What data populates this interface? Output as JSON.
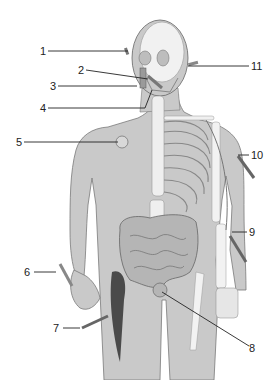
{
  "diagram": {
    "type": "anatomical-figure",
    "labels": [
      {
        "id": 1,
        "text": "1",
        "x": 40,
        "y": 45,
        "target": [
          128,
          51
        ]
      },
      {
        "id": 2,
        "text": "2",
        "x": 78,
        "y": 64,
        "target": [
          148,
          79
        ]
      },
      {
        "id": 3,
        "text": "3",
        "x": 50,
        "y": 80,
        "target": [
          137,
          86
        ]
      },
      {
        "id": 4,
        "text": "4",
        "x": 40,
        "y": 102,
        "target": [
          152,
          88
        ]
      },
      {
        "id": 5,
        "text": "5",
        "x": 16,
        "y": 136,
        "target": [
          120,
          142
        ]
      },
      {
        "id": 6,
        "text": "6",
        "x": 24,
        "y": 266,
        "target": [
          55,
          272
        ]
      },
      {
        "id": 7,
        "text": "7",
        "x": 53,
        "y": 322,
        "target": [
          80,
          328
        ]
      },
      {
        "id": 8,
        "text": "8",
        "x": 249,
        "y": 342,
        "target": [
          162,
          290
        ]
      },
      {
        "id": 9,
        "text": "9",
        "x": 249,
        "y": 226,
        "target": [
          228,
          232
        ]
      },
      {
        "id": 10,
        "text": "10",
        "x": 251,
        "y": 149,
        "target": [
          237,
          155
        ]
      },
      {
        "id": 11,
        "text": "11",
        "x": 251,
        "y": 60,
        "target": [
          188,
          66
        ]
      }
    ],
    "colors": {
      "skin": "#c9c9c9",
      "skin_dark": "#a8a8a8",
      "bone": "#f2f2f2",
      "outline": "#555555",
      "line": "#222222",
      "muscle": "#4a4a4a",
      "background": "#ffffff"
    }
  }
}
